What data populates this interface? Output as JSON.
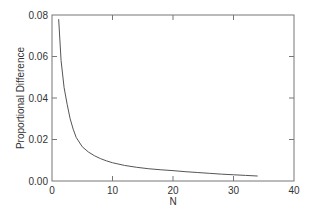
{
  "chart_data": {
    "type": "line",
    "title": "",
    "xlabel": "N",
    "ylabel": "Proportional Difference",
    "xlim": [
      0,
      40
    ],
    "ylim": [
      0,
      0.08
    ],
    "xticks": [
      0,
      10,
      20,
      30,
      40
    ],
    "xtick_labels": [
      "0",
      "10",
      "20",
      "30",
      "40"
    ],
    "yticks": [
      0,
      0.02,
      0.04,
      0.06,
      0.08
    ],
    "ytick_labels": [
      "0.00",
      "0.02",
      "0.04",
      "0.06",
      "0.08"
    ],
    "grid": false,
    "legend": "none",
    "series": [
      {
        "name": "Proportional Difference",
        "color": "#555555",
        "x": [
          1.1,
          1.5,
          2,
          2.5,
          3,
          3.5,
          4,
          5,
          6,
          7,
          8,
          9,
          10,
          12,
          14,
          16,
          18,
          20,
          22,
          24,
          26,
          28,
          30,
          32,
          34
        ],
        "y": [
          0.078,
          0.058,
          0.045,
          0.037,
          0.03,
          0.025,
          0.021,
          0.0165,
          0.014,
          0.0122,
          0.0108,
          0.0097,
          0.0088,
          0.0075,
          0.0066,
          0.0059,
          0.0054,
          0.005,
          0.0045,
          0.0041,
          0.0037,
          0.0033,
          0.003,
          0.0027,
          0.0024
        ]
      }
    ]
  }
}
